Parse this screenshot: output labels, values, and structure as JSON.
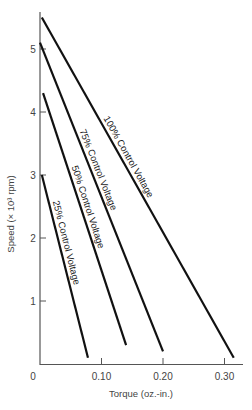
{
  "chart_data": {
    "type": "line",
    "title": "",
    "xlabel": "Torque (oz.-in.)",
    "ylabel": "Speed (× 10³ rpm)",
    "xlim": [
      0,
      0.33
    ],
    "ylim": [
      0,
      5.6
    ],
    "grid": false,
    "legend": "inline labels along lines",
    "x_ticks": [
      {
        "value": 0,
        "label": "0"
      },
      {
        "value": 0.1,
        "label": "0.10"
      },
      {
        "value": 0.2,
        "label": "0.20"
      },
      {
        "value": 0.3,
        "label": "0.30"
      }
    ],
    "y_ticks": [
      {
        "value": 1,
        "label": "1"
      },
      {
        "value": 2,
        "label": "2"
      },
      {
        "value": 3,
        "label": "3"
      },
      {
        "value": 4,
        "label": "4"
      },
      {
        "value": 5,
        "label": "5"
      }
    ],
    "series": [
      {
        "name": "25% Control Voltage",
        "x": [
          0.003,
          0.078
        ],
        "y": [
          3.0,
          0.1
        ],
        "label_pos": 0.38
      },
      {
        "name": "50% Control Voltage",
        "x": [
          0.005,
          0.14
        ],
        "y": [
          4.3,
          0.3
        ],
        "label_pos": 0.46
      },
      {
        "name": "75% Control Voltage",
        "x": [
          0.0,
          0.2
        ],
        "y": [
          5.1,
          0.2
        ],
        "label_pos": 0.42
      },
      {
        "name": "100% Control Voltage",
        "x": [
          0.003,
          0.315
        ],
        "y": [
          5.5,
          0.1
        ],
        "label_pos": 0.42
      }
    ]
  },
  "colors": {
    "line": "#111111",
    "axis": "#555555",
    "text": "#444444",
    "background": "#ffffff"
  }
}
